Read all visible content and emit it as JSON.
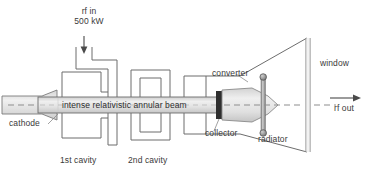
{
  "figure": {
    "ink_color": "#4a4a4a",
    "fill_light": "#e9e9e9",
    "fill_mid": "#d8d8d8",
    "fill_dark": "#3a3a3a",
    "background": "#ffffff"
  },
  "labels": {
    "rf_in_line1": "rf in",
    "rf_in_line2": "500 kW",
    "cathode": "cathode",
    "beam": "intense relativistic annular beam",
    "cavity_1": "1st cavity",
    "cavity_2": "2nd cavity",
    "converter": "converter",
    "collector": "collector",
    "radiator": "radiator",
    "window": "window",
    "rf_out": "rf out"
  },
  "icons": {
    "rf_in_arrow": "down-arrow-icon",
    "rf_out_arrow": "right-arrow-icon",
    "beam_axis": "dashed-axis-line-icon",
    "support_bolt": "bolt-icon"
  },
  "components": [
    {
      "name": "cathode",
      "label": "cathode"
    },
    {
      "name": "input-waveguide",
      "label": "rf in 500 kW"
    },
    {
      "name": "first-cavity",
      "label": "1st cavity"
    },
    {
      "name": "second-cavity",
      "label": "2nd cavity"
    },
    {
      "name": "beam-tube",
      "label": "intense relativistic annular beam"
    },
    {
      "name": "collector",
      "label": "collector"
    },
    {
      "name": "converter",
      "label": "converter"
    },
    {
      "name": "radiator-horn",
      "label": "radiator"
    },
    {
      "name": "output-window",
      "label": "window"
    },
    {
      "name": "rf-output",
      "label": "rf out"
    }
  ]
}
